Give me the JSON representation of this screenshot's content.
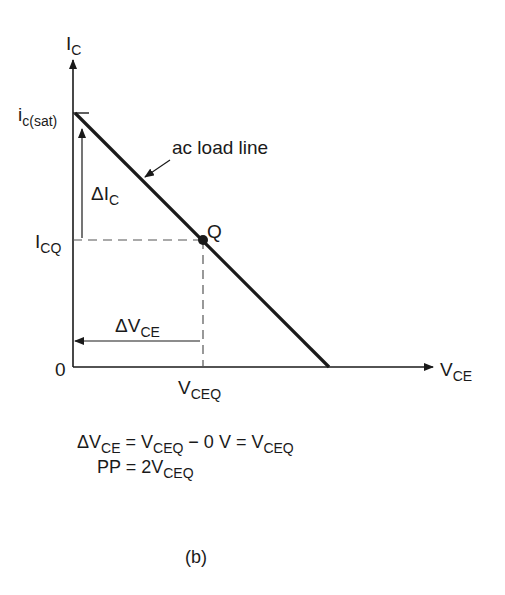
{
  "diagram": {
    "axis_y": {
      "main": "I",
      "sub": "C"
    },
    "axis_x": {
      "main": "V",
      "sub": "CE"
    },
    "origin_label": "0",
    "sat_label": {
      "main": "i",
      "sub": "c(sat)"
    },
    "icq_label": {
      "main": "I",
      "sub": "CQ"
    },
    "vceq_label": {
      "main": "V",
      "sub": "CEQ"
    },
    "delta_ic_label": {
      "main": "ΔI",
      "sub": "C"
    },
    "delta_vce_label": {
      "main": "ΔV",
      "sub": "CE"
    },
    "q_label": "Q",
    "load_line_label": "ac load line",
    "equations": {
      "line1": {
        "p1": "ΔV",
        "s1": "CE",
        "p2": " = V",
        "s2": "CEQ",
        "p3": " − 0 V = V",
        "s3": "CEQ"
      },
      "line2": {
        "p1": "PP = 2V",
        "s1": "CEQ"
      }
    },
    "caption": "(b)",
    "colors": {
      "line": "#1a1a1a",
      "dash": "#555555",
      "background": "#ffffff"
    }
  }
}
